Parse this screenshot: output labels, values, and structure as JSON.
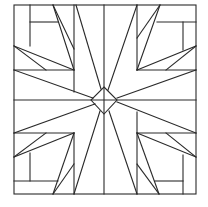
{
  "diagram": {
    "type": "quilt-block-pattern",
    "stroke_color": "#2a2a2a",
    "background_color": "#ffffff",
    "outer_square": {
      "x1": 14,
      "y1": 5,
      "x2": 196,
      "y2": 194
    },
    "center": {
      "x": 104,
      "y": 100
    },
    "center_diamond": [
      [
        104,
        87
      ],
      [
        117,
        100
      ],
      [
        104,
        114
      ],
      [
        91,
        100
      ]
    ]
  }
}
